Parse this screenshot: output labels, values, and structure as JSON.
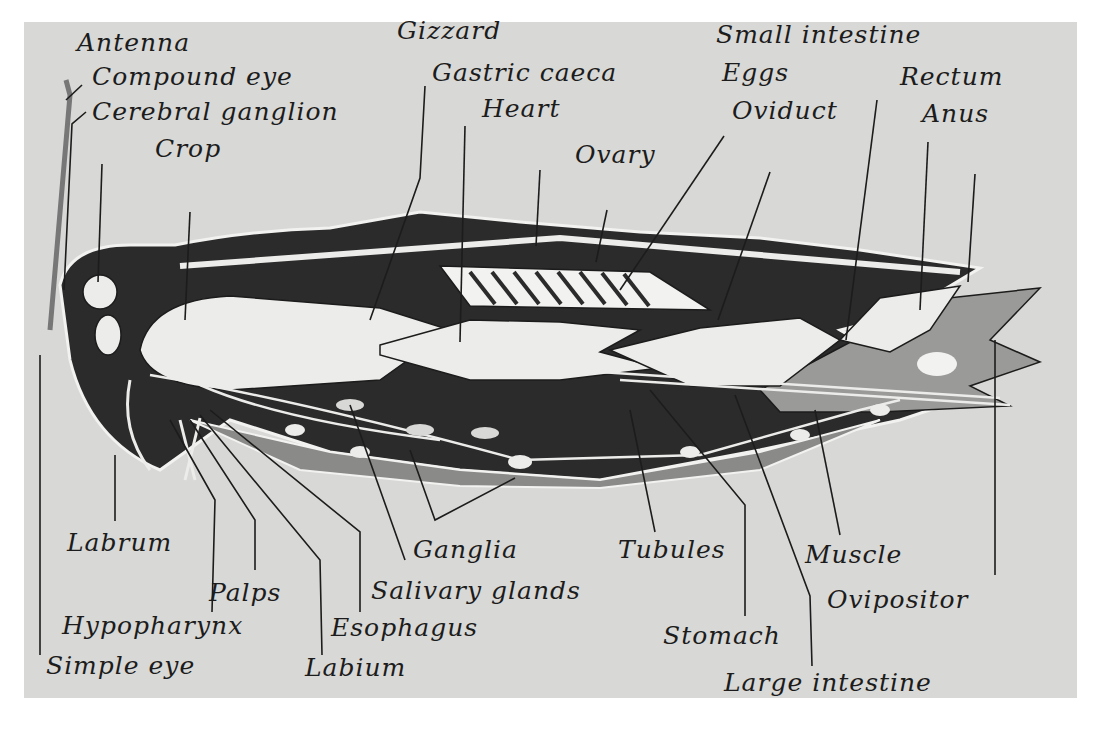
{
  "diagram": {
    "colors": {
      "background": "#d8d8d6",
      "body_dark": "#2a2a2a",
      "organ_light": "#ececea",
      "body_mid": "#8a8a88",
      "line": "#1c1c1c"
    },
    "labels_top": [
      {
        "id": "antenna",
        "text": "Antenna"
      },
      {
        "id": "compound-eye",
        "text": "Compound eye"
      },
      {
        "id": "cerebral-ganglion",
        "text": "Cerebral ganglion"
      },
      {
        "id": "crop",
        "text": "Crop"
      },
      {
        "id": "gizzard",
        "text": "Gizzard"
      },
      {
        "id": "gastric-caeca",
        "text": "Gastric caeca"
      },
      {
        "id": "heart",
        "text": "Heart"
      },
      {
        "id": "ovary",
        "text": "Ovary"
      },
      {
        "id": "eggs",
        "text": "Eggs"
      },
      {
        "id": "oviduct",
        "text": "Oviduct"
      },
      {
        "id": "small-intestine",
        "text": "Small intestine"
      },
      {
        "id": "rectum",
        "text": "Rectum"
      },
      {
        "id": "anus",
        "text": "Anus"
      }
    ],
    "labels_bottom": [
      {
        "id": "labrum",
        "text": "Labrum"
      },
      {
        "id": "palps",
        "text": "Palps"
      },
      {
        "id": "hypopharynx",
        "text": "Hypopharynx"
      },
      {
        "id": "simple-eye",
        "text": "Simple eye"
      },
      {
        "id": "labium",
        "text": "Labium"
      },
      {
        "id": "esophagus",
        "text": "Esophagus"
      },
      {
        "id": "salivary-glands",
        "text": "Salivary glands"
      },
      {
        "id": "ganglia",
        "text": "Ganglia"
      },
      {
        "id": "tubules",
        "text": "Tubules"
      },
      {
        "id": "stomach",
        "text": "Stomach"
      },
      {
        "id": "large-intestine",
        "text": "Large intestine"
      },
      {
        "id": "muscle",
        "text": "Muscle"
      },
      {
        "id": "ovipositor",
        "text": "Ovipositor"
      }
    ]
  }
}
